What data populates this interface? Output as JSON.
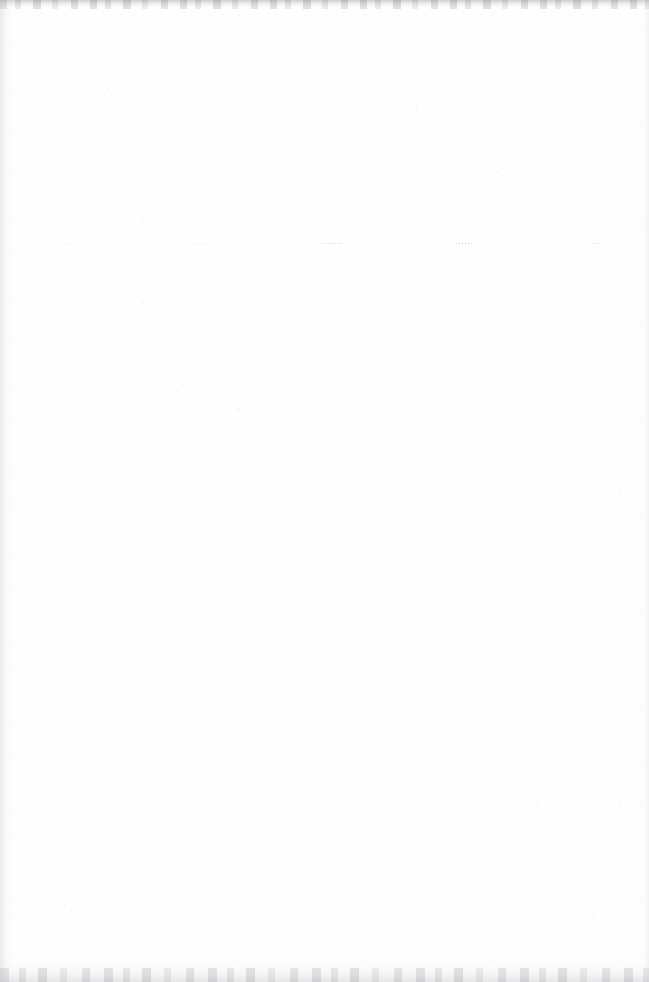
{
  "page": {
    "kind": "scanned-document-page",
    "state": "blank",
    "width_px": 649,
    "height_px": 982,
    "orientation": "portrait",
    "paper_color": "#fefefe",
    "ink_color": "#6c6c72",
    "note": "Scanned page is blank apart from one row of five very faint, illegible gray text marks near the top."
  },
  "content_line": {
    "baseline_y_px": 245,
    "legible": false,
    "marks": [
      {
        "id": "mark-1",
        "text": "······",
        "x_px": 58,
        "width_px": 44,
        "opacity": 0.2,
        "darkness": "very-faint"
      },
      {
        "id": "mark-2",
        "text": "·······",
        "x_px": 188,
        "width_px": 54,
        "opacity": 0.22,
        "darkness": "very-faint"
      },
      {
        "id": "mark-3",
        "text": "·······",
        "x_px": 322,
        "width_px": 52,
        "opacity": 0.4,
        "darkness": "medium"
      },
      {
        "id": "mark-4",
        "text": "······",
        "x_px": 455,
        "width_px": 47,
        "opacity": 0.52,
        "darkness": "darkest"
      },
      {
        "id": "mark-5",
        "text": "·····",
        "x_px": 588,
        "width_px": 39,
        "opacity": 0.3,
        "darkness": "faint"
      }
    ]
  },
  "scan_artifacts": {
    "top_edge": {
      "height_px": 9,
      "color": "#a8a8ac"
    },
    "bottom_edge": {
      "height_px": 27,
      "color": "#cecad2"
    },
    "left_edge": {
      "width_px": 14,
      "color": "#c4c4c9"
    },
    "right_edge": {
      "width_px": 10,
      "color": "#d0d0d5"
    },
    "speckle": {
      "present": true,
      "color": "#8c8c92"
    }
  }
}
